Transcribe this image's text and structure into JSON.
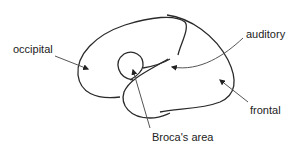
{
  "diagram": {
    "type": "brain-outline-labeled",
    "labels": {
      "occipital": "occipital",
      "auditory": "auditory",
      "frontal": "frontal",
      "broca": "Broca's area"
    },
    "colors": {
      "outline": "#2a2a2a",
      "arrow": "#555555",
      "text": "#222222",
      "background": "#ffffff"
    }
  }
}
